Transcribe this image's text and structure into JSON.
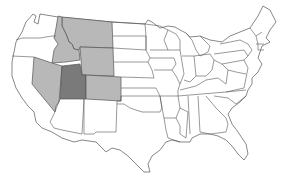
{
  "map": {
    "title": "",
    "region": "Contiguous United States",
    "colors": {
      "background": "#ffffff",
      "default_fill": "#ffffff",
      "outline": "#555555",
      "highlight_dark": "#7a7a7a",
      "highlight_light": "#b8b8b8"
    },
    "highlighted_states": [
      {
        "name": "Utah",
        "shade": "dark"
      },
      {
        "name": "Nevada",
        "shade": "light"
      },
      {
        "name": "Idaho",
        "shade": "light"
      },
      {
        "name": "Montana",
        "shade": "light"
      },
      {
        "name": "Wyoming",
        "shade": "light"
      },
      {
        "name": "Colorado",
        "shade": "light"
      }
    ]
  }
}
